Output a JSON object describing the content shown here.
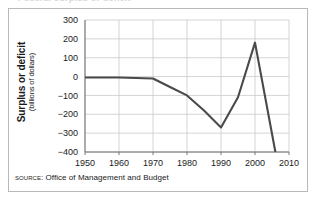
{
  "figure": {
    "clipped_title_remnant": "Federal surplus or deficit",
    "source_kicker": "Source:",
    "source_text": "Office of Management and Budget"
  },
  "axis_title": {
    "main": "Surplus or deficit",
    "sub": "(billions of dollars)"
  },
  "colors": {
    "line": "#4a4a4a",
    "grid": "#c9c9c9",
    "axis": "#6e6e6e",
    "border": "#b9b9b9",
    "text": "#1a1a1a",
    "background": "#ffffff"
  },
  "chart_data": {
    "type": "line",
    "title": "",
    "xlabel": "",
    "ylabel": "Surplus or deficit (billions of dollars)",
    "xlim": [
      1950,
      2010
    ],
    "ylim": [
      -400,
      300
    ],
    "xticks": [
      1950,
      1960,
      1970,
      1980,
      1990,
      2000,
      2010
    ],
    "yticks": [
      300,
      200,
      100,
      0,
      -100,
      -200,
      -300,
      -400
    ],
    "xtick_labels": [
      "1950",
      "1960",
      "1970",
      "1980",
      "1990",
      "2000",
      "2010"
    ],
    "ytick_labels": [
      "300",
      "200",
      "100",
      "0",
      "−100",
      "−200",
      "−300",
      "−400"
    ],
    "grid": true,
    "legend": "none",
    "series": [
      {
        "name": "Federal surplus or deficit",
        "x": [
          1950,
          1960,
          1970,
          1975,
          1980,
          1985,
          1990,
          1995,
          2000,
          2006
        ],
        "values": [
          -5,
          -5,
          -10,
          -55,
          -100,
          -180,
          -270,
          -110,
          180,
          -400
        ]
      }
    ]
  }
}
